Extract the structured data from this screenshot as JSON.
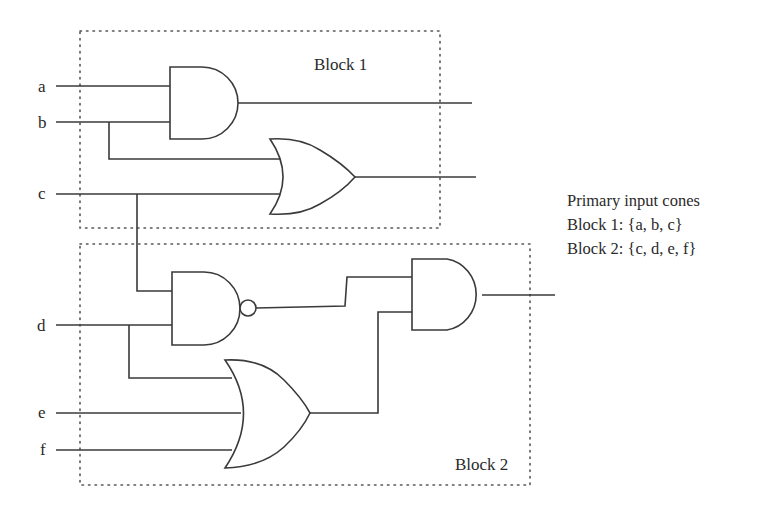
{
  "diagram": {
    "type": "logic-circuit",
    "inputs": [
      "a",
      "b",
      "c",
      "d",
      "e",
      "f"
    ],
    "blocks": [
      {
        "label": "Block 1",
        "gates": [
          "AND(a,b)",
          "OR(b,c)"
        ]
      },
      {
        "label": "Block 2",
        "gates": [
          "NAND(c,d)",
          "OR(d,e,f)",
          "AND(NAND,OR)"
        ]
      }
    ],
    "annotation": {
      "title": "Primary input cones",
      "lines": [
        "Block 1: {a, b, c}",
        "Block 2: {c, d, e, f}"
      ]
    },
    "colors": {
      "stroke": "#3a3a3a",
      "text": "#2a2a2a",
      "background": "#ffffff"
    }
  }
}
